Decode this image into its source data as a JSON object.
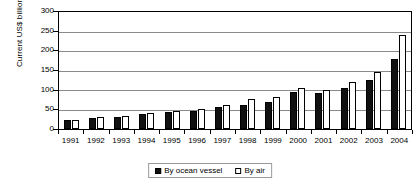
{
  "chart_data": {
    "type": "bar",
    "title": "",
    "xlabel": "",
    "ylabel": "Current US$ billion",
    "ylim": [
      0,
      300
    ],
    "yticks": [
      0,
      50,
      100,
      150,
      200,
      250,
      300
    ],
    "grid": true,
    "legend_position": "bottom",
    "categories": [
      "1991",
      "1992",
      "1993",
      "1994",
      "1995",
      "1996",
      "1997",
      "1998",
      "1999",
      "2000",
      "2001",
      "2002",
      "2003",
      "2004"
    ],
    "series": [
      {
        "name": "By ocean vessel",
        "color": "#111111",
        "values": [
          22,
          28,
          30,
          38,
          43,
          47,
          57,
          62,
          70,
          95,
          92,
          105,
          125,
          180
        ]
      },
      {
        "name": "By air",
        "color": "#ffffff",
        "values": [
          24,
          30,
          33,
          41,
          46,
          51,
          62,
          78,
          81,
          105,
          100,
          120,
          145,
          240
        ]
      }
    ]
  },
  "legend": {
    "items": [
      {
        "label": "By ocean vessel",
        "swatch": "filled-black-square-icon"
      },
      {
        "label": "By air",
        "swatch": "outlined-white-square-icon"
      }
    ]
  }
}
